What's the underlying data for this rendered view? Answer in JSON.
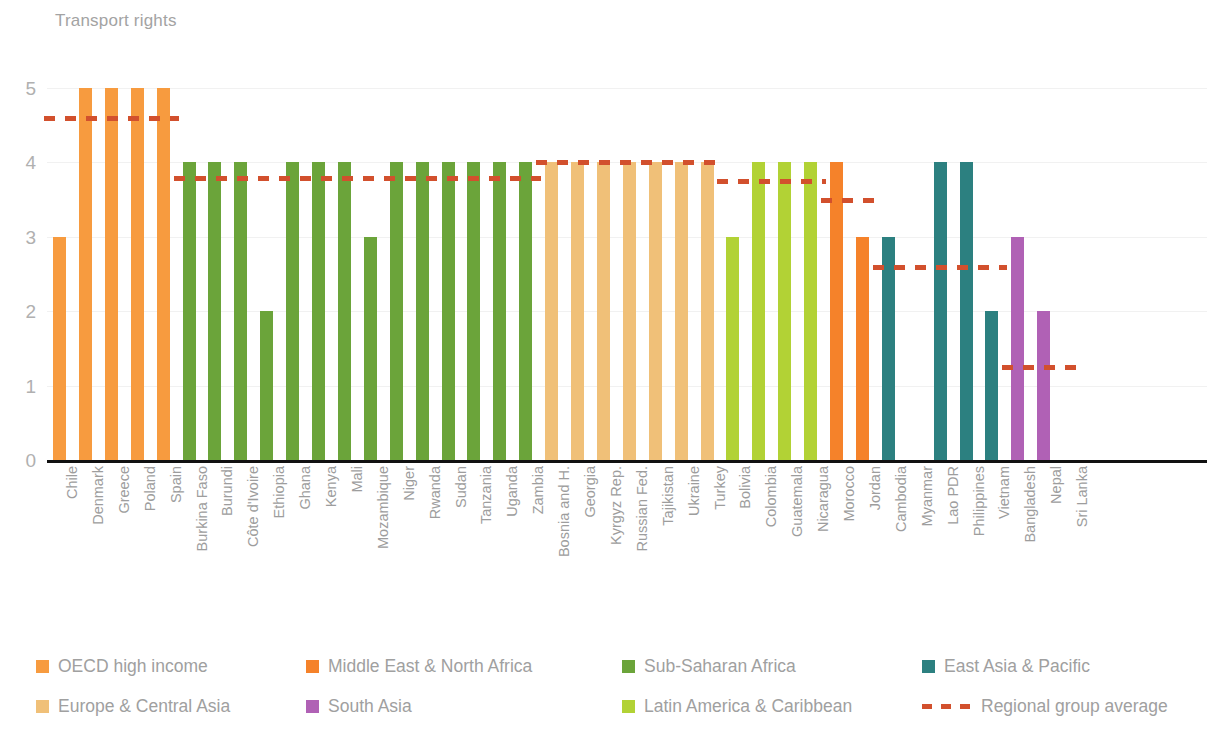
{
  "chart_data": {
    "type": "bar",
    "title": "Transport rights",
    "xlabel": "",
    "ylabel": "",
    "ylim": [
      0,
      5
    ],
    "yticks": [
      0,
      1,
      2,
      3,
      4,
      5
    ],
    "grid": true,
    "legend_position": "bottom",
    "categories": [
      "Chile",
      "Denmark",
      "Greece",
      "Poland",
      "Spain",
      "Burkina Faso",
      "Burundi",
      "Côte d'Ivoire",
      "Ethiopia",
      "Ghana",
      "Kenya",
      "Mali",
      "Mozambique",
      "Niger",
      "Rwanda",
      "Sudan",
      "Tanzania",
      "Uganda",
      "Zambia",
      "Bosnia and H.",
      "Georgia",
      "Kyrgyz Rep.",
      "Russian Fed.",
      "Tajikistan",
      "Ukraine",
      "Turkey",
      "Bolivia",
      "Colombia",
      "Guatemala",
      "Nicaragua",
      "Morocco",
      "Jordan",
      "Cambodia",
      "Myanmar",
      "Lao PDR",
      "Philippines",
      "Vietnam",
      "Bangladesh",
      "Nepal",
      "Sri Lanka"
    ],
    "values": [
      3,
      5,
      5,
      5,
      5,
      4,
      4,
      4,
      2,
      4,
      4,
      4,
      3,
      4,
      4,
      4,
      4,
      4,
      4,
      4,
      4,
      4,
      4,
      4,
      4,
      4,
      3,
      4,
      4,
      4,
      4,
      3,
      3,
      0,
      4,
      4,
      2,
      3,
      2,
      0
    ],
    "groups": [
      "OECD high income",
      "OECD high income",
      "OECD high income",
      "OECD high income",
      "OECD high income",
      "Sub-Saharan Africa",
      "Sub-Saharan Africa",
      "Sub-Saharan Africa",
      "Sub-Saharan Africa",
      "Sub-Saharan Africa",
      "Sub-Saharan Africa",
      "Sub-Saharan Africa",
      "Sub-Saharan Africa",
      "Sub-Saharan Africa",
      "Sub-Saharan Africa",
      "Sub-Saharan Africa",
      "Sub-Saharan Africa",
      "Sub-Saharan Africa",
      "Sub-Saharan Africa",
      "Europe & Central Asia",
      "Europe & Central Asia",
      "Europe & Central Asia",
      "Europe & Central Asia",
      "Europe & Central Asia",
      "Europe & Central Asia",
      "Europe & Central Asia",
      "Latin America & Caribbean",
      "Latin America & Caribbean",
      "Latin America & Caribbean",
      "Latin America & Caribbean",
      "Middle East & North Africa",
      "Middle East & North Africa",
      "East Asia & Pacific",
      "East Asia & Pacific",
      "East Asia & Pacific",
      "East Asia & Pacific",
      "East Asia & Pacific",
      "South Asia",
      "South Asia",
      "South Asia"
    ],
    "group_averages": [
      {
        "group": "OECD high income",
        "value": 4.6,
        "start_index": 0,
        "end_index": 4
      },
      {
        "group": "Sub-Saharan Africa",
        "value": 3.79,
        "start_index": 5,
        "end_index": 18
      },
      {
        "group": "Europe & Central Asia",
        "value": 4.0,
        "start_index": 19,
        "end_index": 25
      },
      {
        "group": "Latin America & Caribbean",
        "value": 3.75,
        "start_index": 26,
        "end_index": 29
      },
      {
        "group": "Middle East & North Africa",
        "value": 3.5,
        "start_index": 30,
        "end_index": 31
      },
      {
        "group": "East Asia & Pacific",
        "value": 2.6,
        "start_index": 32,
        "end_index": 36
      },
      {
        "group": "South Asia",
        "value": 1.25,
        "start_index": 37,
        "end_index": 39
      }
    ],
    "series": [
      {
        "name": "Transport rights",
        "values": [
          3,
          5,
          5,
          5,
          5,
          4,
          4,
          4,
          2,
          4,
          4,
          4,
          3,
          4,
          4,
          4,
          4,
          4,
          4,
          4,
          4,
          4,
          4,
          4,
          4,
          4,
          3,
          4,
          4,
          4,
          4,
          3,
          3,
          0,
          4,
          4,
          2,
          3,
          2,
          0
        ]
      }
    ]
  },
  "colors": {
    "oecd_high_income": "#f79b3f",
    "europe_central_asia": "#f0c078",
    "middle_east_north_africa": "#f5822a",
    "south_asia": "#b061b5",
    "sub_saharan_africa": "#6ba43a",
    "latin_america_caribbean": "#b2d235",
    "east_asia_pacific": "#2c8080",
    "regional_average": "#d2502d",
    "axis": "#111111",
    "gridline": "#f1f1f1",
    "text": "#9d9d9d"
  },
  "legend": {
    "items": [
      {
        "label": "OECD high income",
        "swatch": "oecd_high_income",
        "type": "swatch"
      },
      {
        "label": "Europe & Central Asia",
        "swatch": "europe_central_asia",
        "type": "swatch"
      },
      {
        "label": "Middle East & North Africa",
        "swatch": "middle_east_north_africa",
        "type": "swatch"
      },
      {
        "label": "South Asia",
        "swatch": "south_asia",
        "type": "swatch"
      },
      {
        "label": "Sub-Saharan Africa",
        "swatch": "sub_saharan_africa",
        "type": "swatch"
      },
      {
        "label": "Latin America & Caribbean",
        "swatch": "latin_america_caribbean",
        "type": "swatch"
      },
      {
        "label": "East Asia & Pacific",
        "swatch": "east_asia_pacific",
        "type": "swatch"
      },
      {
        "label": "Regional group average",
        "swatch": "regional_average",
        "type": "dash"
      }
    ],
    "columns_x": [
      0,
      270,
      586,
      886
    ],
    "rows_y": [
      0,
      40
    ]
  }
}
